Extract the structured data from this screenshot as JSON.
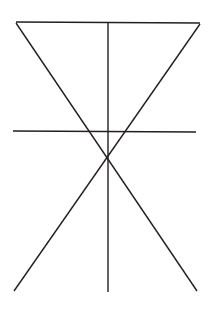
{
  "figure": {
    "background_color": "#ffffff",
    "stroke_color": "#231f20",
    "stroke_width": 1.4,
    "canvas": {
      "width": 213,
      "height": 310
    },
    "key_points": {
      "top_left": [
        16,
        22
      ],
      "top_right": [
        200,
        23
      ],
      "bottom_left": [
        14,
        291
      ],
      "bottom_right": [
        197,
        291
      ],
      "center_crossing": [
        107,
        161
      ],
      "vertical_top": [
        108,
        22
      ],
      "vertical_bottom": [
        108,
        292
      ],
      "horizontal_left": [
        13,
        131
      ],
      "horizontal_right": [
        196,
        132
      ]
    },
    "lines": [
      {
        "name": "top-horizontal-line",
        "x1": 16,
        "y1": 22,
        "x2": 200,
        "y2": 23,
        "label": "Top horizontal"
      },
      {
        "name": "diagonal-top-left-to-bottom-right",
        "x1": 16,
        "y1": 23,
        "x2": 197,
        "y2": 291,
        "label": "Diagonal descending right"
      },
      {
        "name": "diagonal-top-right-to-bottom-left",
        "x1": 200,
        "y1": 24,
        "x2": 14,
        "y2": 291,
        "label": "Diagonal descending left"
      },
      {
        "name": "vertical-center-line",
        "x1": 108,
        "y1": 22,
        "x2": 108,
        "y2": 292,
        "label": "Vertical axis"
      },
      {
        "name": "middle-horizontal-line",
        "x1": 13,
        "y1": 131,
        "x2": 196,
        "y2": 132,
        "label": "Middle horizontal"
      }
    ]
  }
}
